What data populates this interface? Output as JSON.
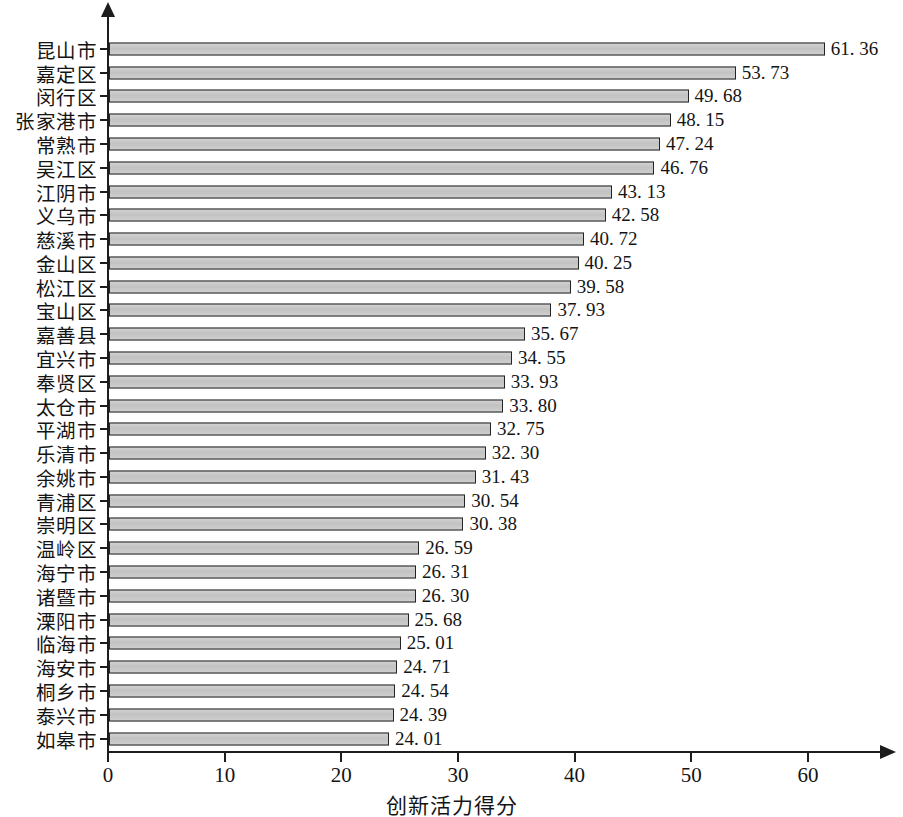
{
  "chart_data": {
    "type": "bar",
    "orientation": "horizontal",
    "title": "",
    "xlabel": "创新活力得分",
    "ylabel": "",
    "xlim": [
      0,
      66
    ],
    "xticks": [
      0,
      10,
      20,
      30,
      40,
      50,
      60
    ],
    "grid": false,
    "legend": null,
    "categories": [
      "昆山市",
      "嘉定区",
      "闵行区",
      "张家港市",
      "常熟市",
      "吴江区",
      "江阴市",
      "义乌市",
      "慈溪市",
      "金山区",
      "松江区",
      "宝山区",
      "嘉善县",
      "宜兴市",
      "奉贤区",
      "太仓市",
      "平湖市",
      "乐清市",
      "余姚市",
      "青浦区",
      "崇明区",
      "温岭区",
      "海宁市",
      "诸暨市",
      "溧阳市",
      "临海市",
      "海安市",
      "桐乡市",
      "泰兴市",
      "如皋市"
    ],
    "values": [
      61.36,
      53.73,
      49.68,
      48.15,
      47.24,
      46.76,
      43.13,
      42.58,
      40.72,
      40.25,
      39.58,
      37.93,
      35.67,
      34.55,
      33.93,
      33.8,
      32.75,
      32.3,
      31.43,
      30.54,
      30.38,
      26.59,
      26.31,
      26.3,
      25.68,
      25.01,
      24.71,
      24.54,
      24.39,
      24.01
    ],
    "value_labels": [
      "61. 36",
      "53. 73",
      "49. 68",
      "48. 15",
      "47. 24",
      "46. 76",
      "43. 13",
      "42. 58",
      "40. 72",
      "40. 25",
      "39. 58",
      "37. 93",
      "35. 67",
      "34. 55",
      "33. 93",
      "33. 80",
      "32. 75",
      "32. 30",
      "31. 43",
      "30. 54",
      "30. 38",
      "26. 59",
      "26. 31",
      "26. 30",
      "25. 68",
      "25. 01",
      "24. 71",
      "24. 54",
      "24. 39",
      "24. 01"
    ],
    "xtick_labels": [
      "0",
      "10",
      "20",
      "30",
      "40",
      "50",
      "60"
    ],
    "colors": {
      "bar_fill": "#c8c8c8",
      "bar_border": "#232323",
      "axis": "#1d1d1d",
      "text": "#141414",
      "background": "#ffffff"
    }
  }
}
